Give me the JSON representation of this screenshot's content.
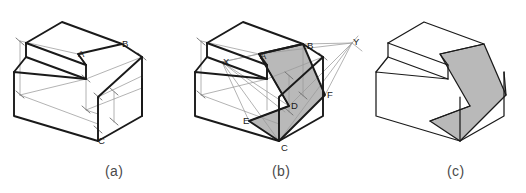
{
  "figure": {
    "background_color": "#ffffff",
    "edge_color": "#1a1a1a",
    "construction_line_color": "#9a9a9a",
    "shaded_face_color": "#b9b9b9",
    "white_face_color": "#ffffff",
    "panels": [
      {
        "id": "a",
        "caption": "(a)",
        "description": "Stepped block in isometric with dimension/construction lines locating points A, B and C",
        "vertex_labels": [
          {
            "name": "A",
            "text": "A",
            "x": 78,
            "y": 54
          },
          {
            "name": "B",
            "text": "B",
            "x": 122,
            "y": 44
          },
          {
            "name": "C",
            "text": "C",
            "x": 98,
            "y": 141
          }
        ]
      },
      {
        "id": "b",
        "caption": "(b)",
        "description": "Same block with vanishing/trace points X and Y and the shaded cut surface A-B-F-C-E-D",
        "vertex_labels": [
          {
            "name": "X",
            "text": "X",
            "x": 223,
            "y": 62
          },
          {
            "name": "A",
            "text": "A",
            "x": 260,
            "y": 56
          },
          {
            "name": "B",
            "text": "B",
            "x": 307,
            "y": 46
          },
          {
            "name": "Y",
            "text": "Y",
            "x": 353,
            "y": 42
          },
          {
            "name": "F",
            "text": "F",
            "x": 327,
            "y": 95
          },
          {
            "name": "D",
            "text": "D",
            "x": 291,
            "y": 106
          },
          {
            "name": "E",
            "text": "E",
            "x": 247,
            "y": 121
          },
          {
            "name": "C",
            "text": "C",
            "x": 281,
            "y": 148
          }
        ]
      },
      {
        "id": "c",
        "caption": "(c)",
        "description": "Finished block with the cut surface shaded, construction lines removed",
        "vertex_labels": []
      }
    ],
    "captions": [
      {
        "name": "caption-a",
        "text": "(a)",
        "left": 105,
        "top": 163
      },
      {
        "name": "caption-b",
        "text": "(b)",
        "left": 272,
        "top": 163
      },
      {
        "name": "caption-c",
        "text": "(c)",
        "left": 447,
        "top": 163
      }
    ]
  }
}
